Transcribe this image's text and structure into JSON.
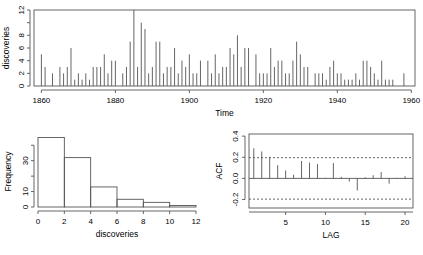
{
  "figure": {
    "name": "discoveries-r-graphics-panel",
    "background": "#ffffff",
    "foreground": "#555555"
  },
  "chart_data": [
    {
      "id": "timeseries",
      "type": "line",
      "subtype": "impulse-time-series",
      "title": "",
      "xlabel": "Time",
      "ylabel": "discoveries",
      "xlim": [
        1858,
        1961
      ],
      "ylim": [
        0,
        12
      ],
      "xticks": [
        1860,
        1880,
        1900,
        1920,
        1940,
        1960
      ],
      "yticks": [
        0,
        2,
        4,
        6,
        8,
        12
      ],
      "ytick_all": [
        0,
        2,
        4,
        6,
        8,
        10,
        12
      ],
      "grid": false,
      "legend": "none",
      "x": [
        1860,
        1861,
        1862,
        1863,
        1864,
        1865,
        1866,
        1867,
        1868,
        1869,
        1870,
        1871,
        1872,
        1873,
        1874,
        1875,
        1876,
        1877,
        1878,
        1879,
        1880,
        1881,
        1882,
        1883,
        1884,
        1885,
        1886,
        1887,
        1888,
        1889,
        1890,
        1891,
        1892,
        1893,
        1894,
        1895,
        1896,
        1897,
        1898,
        1899,
        1900,
        1901,
        1902,
        1903,
        1904,
        1905,
        1906,
        1907,
        1908,
        1909,
        1910,
        1911,
        1912,
        1913,
        1914,
        1915,
        1916,
        1917,
        1918,
        1919,
        1920,
        1921,
        1922,
        1923,
        1924,
        1925,
        1926,
        1927,
        1928,
        1929,
        1930,
        1931,
        1932,
        1933,
        1934,
        1935,
        1936,
        1937,
        1938,
        1939,
        1940,
        1941,
        1942,
        1943,
        1944,
        1945,
        1946,
        1947,
        1948,
        1949,
        1950,
        1951,
        1952,
        1953,
        1954,
        1955,
        1956,
        1957,
        1958,
        1959
      ],
      "values": [
        5,
        3,
        0,
        2,
        0,
        3,
        2,
        3,
        6,
        1,
        2,
        1,
        2,
        1,
        3,
        3,
        3,
        5,
        2,
        4,
        4,
        0,
        2,
        3,
        7,
        12,
        3,
        10,
        9,
        2,
        3,
        7,
        7,
        2,
        3,
        3,
        6,
        2,
        4,
        3,
        5,
        2,
        2,
        4,
        0,
        4,
        2,
        5,
        2,
        3,
        3,
        6,
        5,
        8,
        3,
        6,
        6,
        0,
        5,
        2,
        2,
        2,
        6,
        3,
        4,
        4,
        2,
        2,
        4,
        7,
        5,
        3,
        3,
        0,
        2,
        2,
        2,
        1,
        3,
        4,
        2,
        2,
        1,
        1,
        1,
        2,
        1,
        4,
        4,
        3,
        2,
        1,
        4,
        1,
        1,
        1,
        0,
        0,
        2,
        0
      ]
    },
    {
      "id": "histogram",
      "type": "bar",
      "subtype": "histogram",
      "title": "",
      "xlabel": "discoveries",
      "ylabel": "Frequency",
      "xlim": [
        0,
        12
      ],
      "ylim": [
        0,
        46
      ],
      "xticks": [
        0,
        2,
        4,
        6,
        8,
        10,
        12
      ],
      "yticks": [
        0,
        10,
        30
      ],
      "ytick_all": [
        0,
        10,
        20,
        30,
        40
      ],
      "grid": false,
      "legend": "none",
      "bin_edges": [
        0,
        2,
        4,
        6,
        8,
        10,
        12
      ],
      "categories": [
        "0-2",
        "2-4",
        "4-6",
        "6-8",
        "8-10",
        "10-12"
      ],
      "values": [
        45,
        32,
        13,
        5,
        3,
        1
      ]
    },
    {
      "id": "acf",
      "type": "bar",
      "subtype": "correlogram",
      "title": "",
      "xlabel": "LAG",
      "ylabel": "ACF",
      "xlim": [
        0.4,
        21
      ],
      "ylim": [
        -0.28,
        0.42
      ],
      "xticks": [
        5,
        10,
        15,
        20
      ],
      "yticks": [
        -0.2,
        0.0,
        0.2,
        0.4
      ],
      "grid": false,
      "legend": "none",
      "confidence_bound": 0.196,
      "confidence_line_style": "dashed",
      "x": [
        1,
        2,
        3,
        4,
        5,
        6,
        7,
        8,
        9,
        10,
        11,
        12,
        13,
        14,
        15,
        16,
        17,
        18,
        19,
        20
      ],
      "values": [
        0.285,
        0.255,
        0.205,
        0.125,
        0.075,
        0.035,
        0.165,
        0.15,
        0.135,
        0.005,
        0.145,
        0.015,
        -0.03,
        -0.115,
        0.01,
        0.03,
        0.06,
        -0.05,
        0.005,
        0.02
      ]
    }
  ],
  "labels": {
    "ts_ylabel": "discoveries",
    "ts_xlabel": "Time",
    "hist_ylabel": "Frequency",
    "hist_xlabel": "discoveries",
    "acf_ylabel": "ACF",
    "acf_xlabel": "LAG"
  }
}
